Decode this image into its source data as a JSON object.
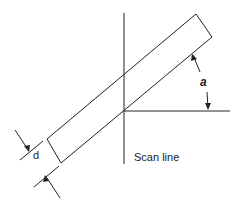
{
  "diagram": {
    "labels": {
      "scan_line": "Scan line",
      "angle": "a",
      "width": "d"
    },
    "line_color": "#222222"
  }
}
